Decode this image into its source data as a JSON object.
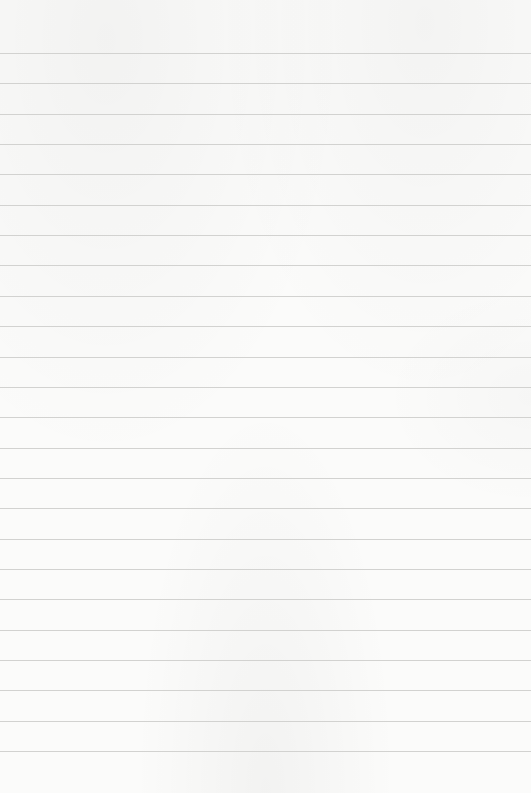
{
  "paper": {
    "type": "lined-paper",
    "background_color": "#fbfbfa",
    "rule_color": "#d2d2d0",
    "rule_count": 24,
    "first_rule_y": 53,
    "rule_spacing": 30.35,
    "text_content": []
  }
}
